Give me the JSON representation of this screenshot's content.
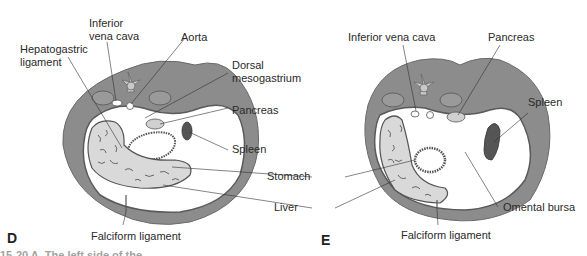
{
  "figure": {
    "panels": [
      {
        "letter": "D",
        "labels": {
          "inferior_vena_cava": [
            "Inferior",
            "vena cava"
          ],
          "aorta": "Aorta",
          "hepatogastric_ligament": [
            "Hepatogastric",
            "ligament"
          ],
          "dorsal_mesogastrium": [
            "Dorsal",
            "mesogastrium"
          ],
          "pancreas": "Pancreas",
          "spleen": "Spleen",
          "falciform_ligament": "Falciform ligament"
        }
      },
      {
        "letter": "E",
        "labels": {
          "inferior_vena_cava": "Inferior vena cava",
          "pancreas": "Pancreas",
          "spleen": "Spleen",
          "omental_bursa": "Omental bursa",
          "falciform_ligament": "Falciform ligament"
        }
      }
    ],
    "shared_labels": {
      "stomach": "Stomach",
      "liver": "Liver"
    },
    "caption_partial": "15-20  A. The left side of the ..."
  },
  "colors": {
    "body_wall": "#8c8c8c",
    "cavity": "#ffffff",
    "organ_outline": "#5a5a5a",
    "liver_fill": "#d9d9d9",
    "spleen_fill": "#555555",
    "pancreas_fill": "#d0d0d0",
    "vertebra_fill": "#c8c8c8"
  }
}
